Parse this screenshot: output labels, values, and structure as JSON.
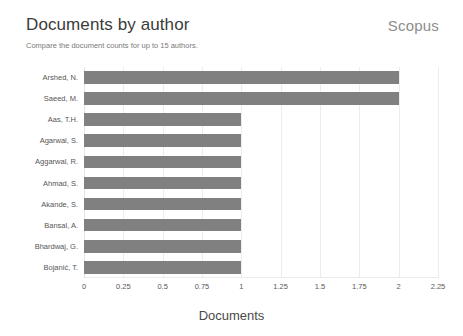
{
  "header": {
    "title": "Documents by author",
    "subtitle": "Compare the document counts for up to 15 authors.",
    "brand": "Scopus"
  },
  "colors": {
    "bar": "#808080",
    "gridline": "#ececec",
    "title_text": "#3b3b3b",
    "subtitle_text": "#7a7a7a",
    "brand_text": "#8c8c8c",
    "axis_text": "#565656"
  },
  "chart_data": {
    "type": "bar",
    "orientation": "horizontal",
    "title": "Documents by author",
    "subtitle": "Compare the document counts for up to 15 authors.",
    "xlabel": "Documents",
    "ylabel": "",
    "xlim": [
      0,
      2.25
    ],
    "xticks": [
      0,
      0.25,
      0.5,
      0.75,
      1,
      1.25,
      1.5,
      1.75,
      2,
      2.25
    ],
    "xticklabels": [
      "0",
      "0.25",
      "0.5",
      "0.75",
      "1",
      "1.25",
      "1.5",
      "1.75",
      "2",
      "2.25"
    ],
    "grid": true,
    "legend": false,
    "categories": [
      "Arshed, N.",
      "Saeed, M.",
      "Aas, T.H.",
      "Agarwal, S.",
      "Aggarwal, R.",
      "Ahmad, S.",
      "Akande, S.",
      "Bansal, A.",
      "Bhardwaj, G.",
      "Bojanić, T."
    ],
    "values": [
      2,
      2,
      1,
      1,
      1,
      1,
      1,
      1,
      1,
      1
    ],
    "series": [
      {
        "name": "Documents",
        "values": [
          2,
          2,
          1,
          1,
          1,
          1,
          1,
          1,
          1,
          1
        ]
      }
    ]
  }
}
